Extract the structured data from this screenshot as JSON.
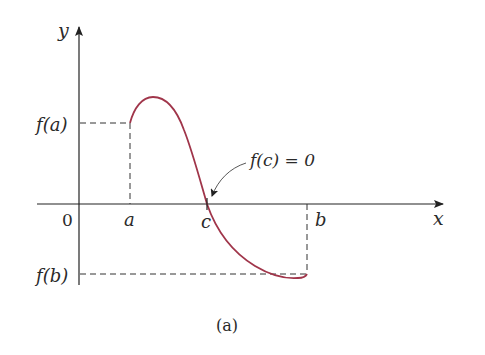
{
  "figure": {
    "caption": "(a)",
    "axes": {
      "x_label": "x",
      "y_label": "y",
      "origin_label": "0"
    },
    "points": {
      "a_label": "a",
      "b_label": "b",
      "c_label": "c",
      "fa_label": "f(a)",
      "fb_label": "f(b)"
    },
    "annotation": "f(c) = 0",
    "colors": {
      "curve": "#a0354a",
      "axes": "#222222",
      "dashes": "#333333"
    }
  }
}
